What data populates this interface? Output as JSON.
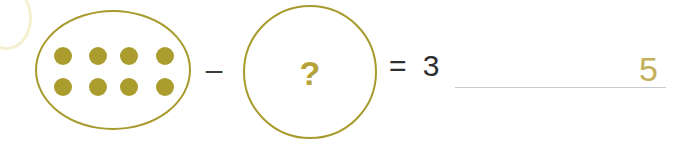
{
  "problem": {
    "type": "subtraction-with-unknown",
    "left_group": {
      "label": "group-of-counters",
      "count": 8,
      "rows": 2,
      "columns": 4,
      "dot_color": "#ab9c2e",
      "ring_color": "#a89a2c",
      "dots": [
        [
          1,
          1,
          1,
          1
        ],
        [
          1,
          1,
          1,
          1
        ]
      ]
    },
    "operator": "–",
    "unknown": {
      "symbol": "?",
      "color": "#b5a238",
      "ring_color": "#a89a2c"
    },
    "equals_expression": "= 3",
    "equals_sign": "=",
    "difference": "3",
    "answer_blank": {
      "written_answer": "5",
      "answer_color": "#c3b05a",
      "rule_color": "#c9c9c9"
    }
  },
  "colors": {
    "background": "#ffffff",
    "gold": "#a89a2c",
    "dot_gold": "#ab9c2e",
    "answer_gold": "#c3b05a",
    "text_dark": "#2e2e2e"
  }
}
